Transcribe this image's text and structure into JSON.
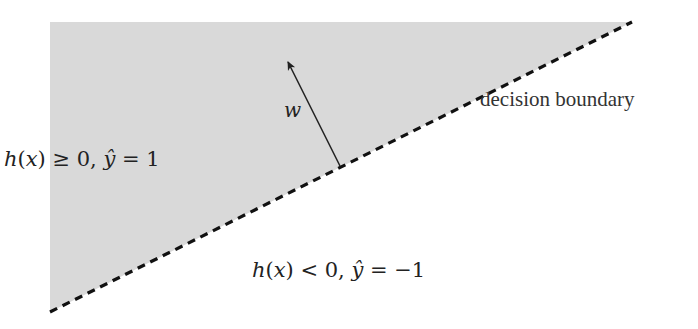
{
  "diagram": {
    "type": "linear-classifier-decision-boundary",
    "colors": {
      "positive_region_fill": "#d9d9d9",
      "background": "#ffffff",
      "boundary_line": "#111111",
      "arrow": "#222222",
      "text": "#222222"
    },
    "positive_region": {
      "label": "h(x) ≥ 0, ŷ = 1",
      "parts": {
        "h": "h",
        "open": "(",
        "x": "x",
        "close": ")",
        "rel": " ≥ 0, ",
        "yhat": "ŷ",
        "rest": " = 1"
      },
      "polygon": [
        [
          50,
          22
        ],
        [
          632,
          22
        ],
        [
          50,
          312
        ]
      ]
    },
    "negative_region": {
      "label": "h(x) < 0, ŷ = −1",
      "parts": {
        "h": "h",
        "open": "(",
        "x": "x",
        "close": ")",
        "rel": " < 0, ",
        "yhat": "ŷ",
        "rest": " = −1"
      }
    },
    "boundary": {
      "label": "decision boundary",
      "style": "dashed",
      "from": [
        50,
        312
      ],
      "to": [
        632,
        22
      ]
    },
    "normal_vector": {
      "label": "w",
      "from": [
        340,
        166
      ],
      "to": [
        287,
        60
      ]
    }
  }
}
